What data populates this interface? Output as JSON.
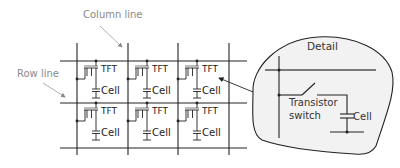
{
  "diagram": {
    "annotations": {
      "column_line": "Column line",
      "row_line": "Row line"
    },
    "grid": {
      "columns": 3,
      "rows": 2,
      "cells": [
        {
          "row": 0,
          "col": 0,
          "transistor_label": "TFT",
          "cell_label": "Cell"
        },
        {
          "row": 0,
          "col": 1,
          "transistor_label": "TFT",
          "cell_label": "Cell"
        },
        {
          "row": 0,
          "col": 2,
          "transistor_label": "TFT",
          "cell_label": "Cell"
        },
        {
          "row": 1,
          "col": 0,
          "transistor_label": "TFT",
          "cell_label": "Cell"
        },
        {
          "row": 1,
          "col": 1,
          "transistor_label": "TFT",
          "cell_label": "Cell"
        },
        {
          "row": 1,
          "col": 2,
          "transistor_label": "TFT",
          "cell_label": "Cell"
        }
      ]
    },
    "detail": {
      "title": "Detail",
      "switch_label_line1": "Transistor",
      "switch_label_line2": "switch",
      "cell_label": "Cell"
    },
    "colors": {
      "line": "#222222",
      "annotation_text": "#8a8a8a",
      "annotation_arrow": "#9a9a9a",
      "detail_fill": "#f2f2f2"
    }
  }
}
